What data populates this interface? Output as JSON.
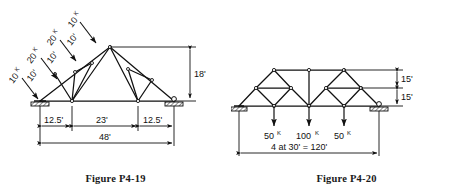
{
  "document": {
    "type": "structural-engineering-textbook-figures",
    "background_color": "#ffffff",
    "line_color": "#111111"
  },
  "figures": [
    {
      "id": "P4-19",
      "caption": "Figure P4-19",
      "description": "Fink roof truss with inclined loads on the left top chord",
      "supports": {
        "left": "pin",
        "right": "roller"
      },
      "height_label": "18'",
      "span_label": "48'",
      "bottom_dimensions": [
        "12.5'",
        "23'",
        "12.5'"
      ],
      "panel_dimensions": [
        "10'",
        "10'",
        "10'"
      ],
      "loads": [
        {
          "label": "10",
          "unit": "K"
        },
        {
          "label": "20",
          "unit": "K"
        },
        {
          "label": "20",
          "unit": "K"
        },
        {
          "label": "10",
          "unit": "K"
        }
      ]
    },
    {
      "id": "P4-20",
      "caption": "Figure P4-20",
      "description": "Two-module diamond truss with three vertical point loads",
      "supports": {
        "left": "pin",
        "right": "roller"
      },
      "height_labels": [
        "15'",
        "15'"
      ],
      "span_label": "4 at 30' = 120'",
      "loads": [
        {
          "label": "50",
          "unit": "K"
        },
        {
          "label": "100",
          "unit": "K"
        },
        {
          "label": "50",
          "unit": "K"
        }
      ]
    }
  ]
}
